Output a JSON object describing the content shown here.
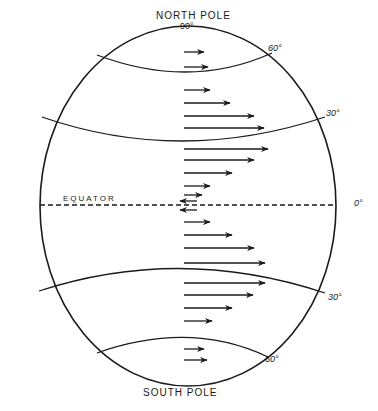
{
  "diagram": {
    "labels": {
      "north_pole": "NORTH POLE",
      "north_deg": "90°",
      "south_pole": "SOUTH POLE",
      "equator": "EQUATOR",
      "lat60_n": "60°",
      "lat30_n": "30°",
      "lat0": "0°",
      "lat30_s": "30°",
      "lat60_s": "60°"
    },
    "colors": {
      "ink": "#1a1a1a",
      "background": "#ffffff"
    },
    "globe": {
      "cx": 188,
      "cy": 206,
      "rx": 148,
      "ry": 180
    },
    "arrows": [
      {
        "y": 52,
        "x1": 184,
        "x2": 204,
        "dir": "east"
      },
      {
        "y": 67,
        "x1": 184,
        "x2": 208,
        "dir": "east"
      },
      {
        "y": 90,
        "x1": 184,
        "x2": 210,
        "dir": "east"
      },
      {
        "y": 103,
        "x1": 184,
        "x2": 230,
        "dir": "east"
      },
      {
        "y": 116,
        "x1": 184,
        "x2": 254,
        "dir": "east"
      },
      {
        "y": 128,
        "x1": 184,
        "x2": 264,
        "dir": "east"
      },
      {
        "y": 149,
        "x1": 184,
        "x2": 268,
        "dir": "east"
      },
      {
        "y": 160,
        "x1": 184,
        "x2": 254,
        "dir": "east"
      },
      {
        "y": 173,
        "x1": 184,
        "x2": 232,
        "dir": "east"
      },
      {
        "y": 186,
        "x1": 184,
        "x2": 210,
        "dir": "east"
      },
      {
        "y": 195,
        "x1": 184,
        "x2": 202,
        "dir": "east"
      },
      {
        "y": 201,
        "x1": 197,
        "x2": 180,
        "dir": "west"
      },
      {
        "y": 210,
        "x1": 197,
        "x2": 180,
        "dir": "west"
      },
      {
        "y": 222,
        "x1": 184,
        "x2": 210,
        "dir": "east"
      },
      {
        "y": 235,
        "x1": 184,
        "x2": 232,
        "dir": "east"
      },
      {
        "y": 248,
        "x1": 184,
        "x2": 254,
        "dir": "east"
      },
      {
        "y": 263,
        "x1": 184,
        "x2": 265,
        "dir": "east"
      },
      {
        "y": 283,
        "x1": 184,
        "x2": 265,
        "dir": "east"
      },
      {
        "y": 295,
        "x1": 184,
        "x2": 253,
        "dir": "east"
      },
      {
        "y": 308,
        "x1": 184,
        "x2": 232,
        "dir": "east"
      },
      {
        "y": 321,
        "x1": 184,
        "x2": 212,
        "dir": "east"
      },
      {
        "y": 349,
        "x1": 184,
        "x2": 204,
        "dir": "east"
      },
      {
        "y": 360,
        "x1": 184,
        "x2": 207,
        "dir": "east"
      }
    ]
  }
}
